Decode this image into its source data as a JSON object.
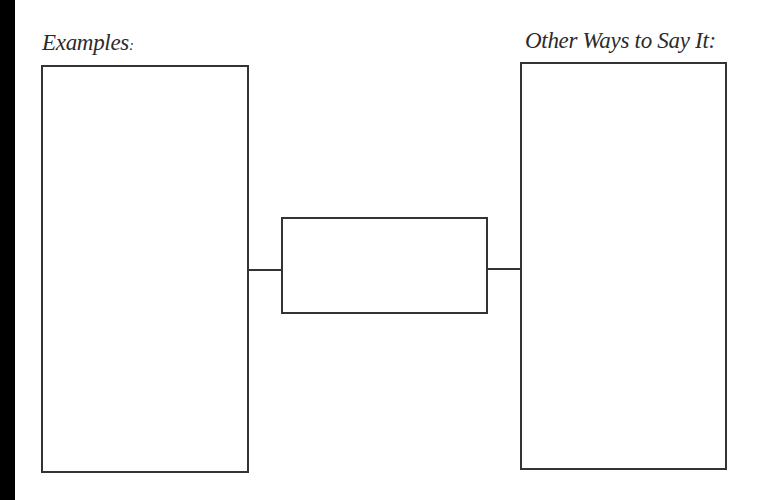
{
  "diagram": {
    "left_panel": {
      "label": "Examples",
      "label_suffix": ":",
      "content": ""
    },
    "center_panel": {
      "content": ""
    },
    "right_panel": {
      "label": "Other Ways to Say It:",
      "content": ""
    },
    "colors": {
      "stroke": "#333333",
      "text": "#2b2b2b",
      "background": "#ffffff",
      "edge_strip": "#000000"
    }
  }
}
